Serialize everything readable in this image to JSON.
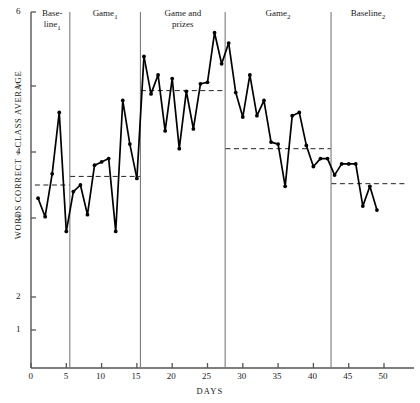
{
  "chart_data": {
    "type": "line",
    "title": "",
    "xlabel": "DAYS",
    "ylabel": "WORDS CORRECT ~ CLASS AVERAGE",
    "xlim": [
      0,
      53
    ],
    "ylim": [
      1,
      6
    ],
    "grid": false,
    "legend_position": "none",
    "y_ticks": [
      1,
      2,
      3,
      4,
      5,
      6
    ],
    "y_tick_labels": [
      "1",
      "2",
      "3",
      "4",
      "5",
      "6"
    ],
    "x_ticks": [
      0,
      5,
      10,
      15,
      20,
      25,
      30,
      35,
      40,
      45,
      50
    ],
    "x_tick_labels": [
      "0",
      "5",
      "10",
      "15",
      "20",
      "25",
      "30",
      "35",
      "40",
      "45",
      "50"
    ],
    "y_axis_note": "vertical scale compressed between 1 and 2",
    "marker": "filled-circle",
    "line_color": "#000000",
    "mean_line_style": "dashed",
    "phase_dividers": [
      5.5,
      15.5,
      27.5,
      42.5
    ],
    "phases": [
      {
        "name": "Baseline",
        "subscript": "1",
        "label": "Base-line₁",
        "label_lines": [
          "Base-",
          "line"
        ],
        "x_start": 0.5,
        "x_end": 5.5,
        "mean": 3.5,
        "x": [
          1,
          2,
          3,
          4,
          5
        ],
        "y": [
          3.3,
          3.02,
          3.67,
          4.6,
          2.83
        ]
      },
      {
        "name": "Game",
        "subscript": "1",
        "label": "Game₁",
        "label_lines": [
          "Game"
        ],
        "x_start": 5.5,
        "x_end": 15.5,
        "mean": 3.63,
        "x": [
          6,
          7,
          8,
          9,
          10,
          11,
          12,
          13,
          14,
          15
        ],
        "y": [
          3.4,
          3.5,
          3.05,
          3.8,
          3.85,
          3.9,
          2.83,
          4.78,
          4.12,
          3.6
        ]
      },
      {
        "name": "Game and prizes",
        "subscript": "",
        "label": "Game and prizes",
        "label_lines": [
          "Game and",
          "prizes"
        ],
        "x_start": 15.5,
        "x_end": 27.5,
        "mean": 4.93,
        "x": [
          16,
          17,
          18,
          19,
          20,
          21,
          22,
          23,
          24,
          25,
          26,
          27
        ],
        "y": [
          5.4,
          4.88,
          5.15,
          4.32,
          5.1,
          4.05,
          4.92,
          4.35,
          5.03,
          5.05,
          5.72,
          5.3
        ]
      },
      {
        "name": "Game",
        "subscript": "2",
        "label": "Game₂",
        "label_lines": [
          "Game"
        ],
        "x_start": 27.5,
        "x_end": 42.5,
        "mean": 4.05,
        "x": [
          28,
          29,
          30,
          31,
          32,
          33,
          34,
          35,
          36,
          37,
          38,
          39,
          40,
          41,
          42
        ],
        "y": [
          5.58,
          4.9,
          4.53,
          5.15,
          4.55,
          4.78,
          4.15,
          4.12,
          3.48,
          4.55,
          4.6,
          4.1,
          3.78,
          3.9,
          3.9
        ]
      },
      {
        "name": "Baseline",
        "subscript": "2",
        "label": "Baseline₂",
        "label_lines": [
          "Baseline"
        ],
        "x_start": 42.5,
        "x_end": 53,
        "mean": 3.52,
        "x": [
          43,
          44,
          45,
          46,
          47,
          48,
          49
        ],
        "y": [
          3.65,
          3.82,
          3.82,
          3.82,
          3.18,
          3.48,
          3.12
        ]
      }
    ]
  },
  "axes": {
    "y_title": "WORDS CORRECT ~ CLASS AVERAGE",
    "x_title": "DAYS"
  }
}
